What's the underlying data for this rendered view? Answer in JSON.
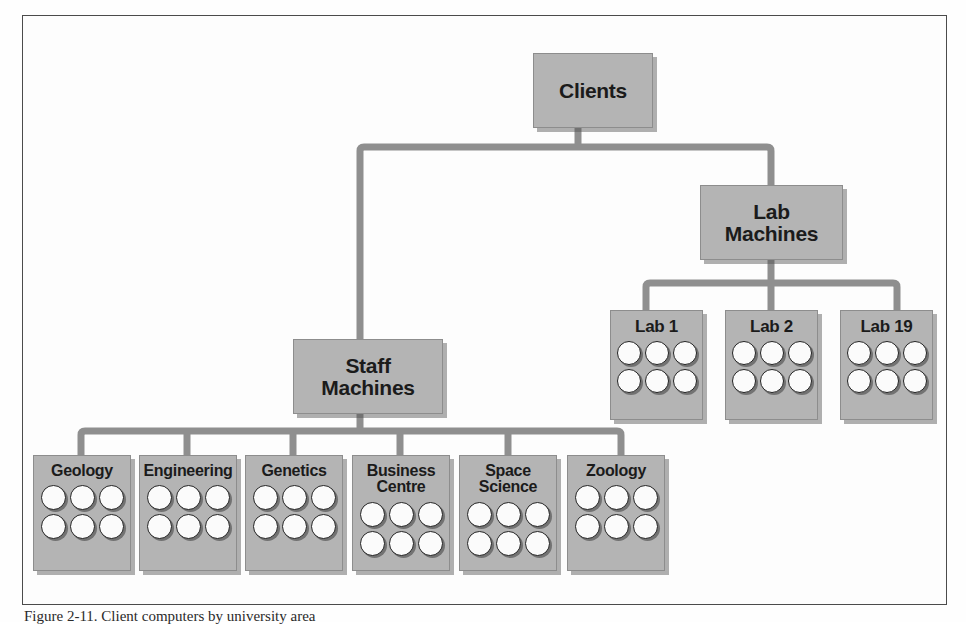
{
  "figure": {
    "caption": "Figure 2-11. Client computers by university area",
    "frame": {
      "border_color": "#4b4b4b"
    }
  },
  "style": {
    "node_fill": "#b4b4b4",
    "node_border": "#8d8d8d",
    "connector_color": "#8f8f8f",
    "text_color": "#1b1b1b",
    "machine_fill": "#fbfbfb",
    "machine_border": "#232323"
  },
  "diagram": {
    "type": "tree",
    "root": {
      "id": "clients",
      "label": "Clients"
    },
    "branches": [
      {
        "id": "staff-machines",
        "label": "Staff\nMachines",
        "children": [
          {
            "id": "geology",
            "label": "Geology",
            "machine_count": 6
          },
          {
            "id": "engineering",
            "label": "Engineering",
            "machine_count": 6
          },
          {
            "id": "genetics",
            "label": "Genetics",
            "machine_count": 6
          },
          {
            "id": "business-centre",
            "label": "Business\nCentre",
            "machine_count": 6
          },
          {
            "id": "space-science",
            "label": "Space\nScience",
            "machine_count": 6
          },
          {
            "id": "zoology",
            "label": "Zoology",
            "machine_count": 6
          }
        ]
      },
      {
        "id": "lab-machines",
        "label": "Lab\nMachines",
        "children": [
          {
            "id": "lab-1",
            "label": "Lab 1",
            "machine_count": 6
          },
          {
            "id": "lab-2",
            "label": "Lab 2",
            "machine_count": 6
          },
          {
            "id": "lab-19",
            "label": "Lab 19",
            "machine_count": 6
          }
        ]
      }
    ]
  },
  "nodes": {
    "clients": {
      "label": "Clients"
    },
    "staff_machines": {
      "label": "Staff\nMachines"
    },
    "lab_machines": {
      "label": "Lab\nMachines"
    },
    "geology": {
      "label": "Geology"
    },
    "engineering": {
      "label": "Engineering"
    },
    "genetics": {
      "label": "Genetics"
    },
    "business_centre": {
      "label": "Business\nCentre"
    },
    "space_science": {
      "label": "Space\nScience"
    },
    "zoology": {
      "label": "Zoology"
    },
    "lab_1": {
      "label": "Lab 1"
    },
    "lab_2": {
      "label": "Lab 2"
    },
    "lab_19": {
      "label": "Lab 19"
    }
  }
}
